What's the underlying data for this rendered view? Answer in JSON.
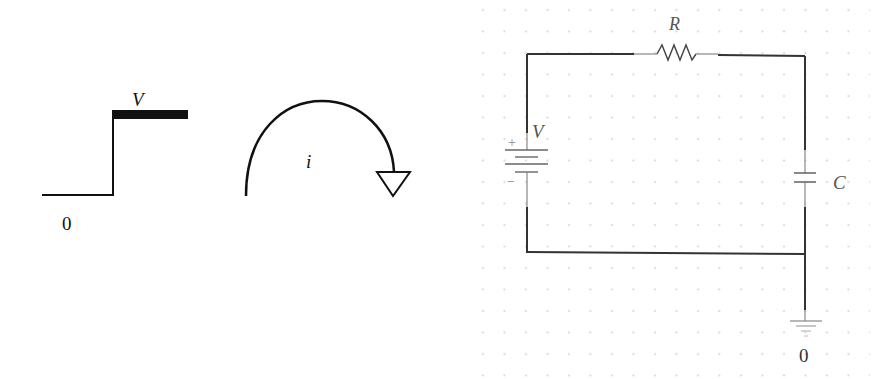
{
  "step_input": {
    "high_label": "V",
    "low_label": "0"
  },
  "current_arrow": {
    "label": "i"
  },
  "circuit": {
    "resistor_label": "R",
    "source_label": "V",
    "source_plus": "+",
    "source_minus": "−",
    "capacitor_label": "C",
    "ground_label": "0",
    "colors": {
      "wire": "#333333",
      "component": "#555555",
      "grid_dot": "#c8c8c8"
    }
  }
}
